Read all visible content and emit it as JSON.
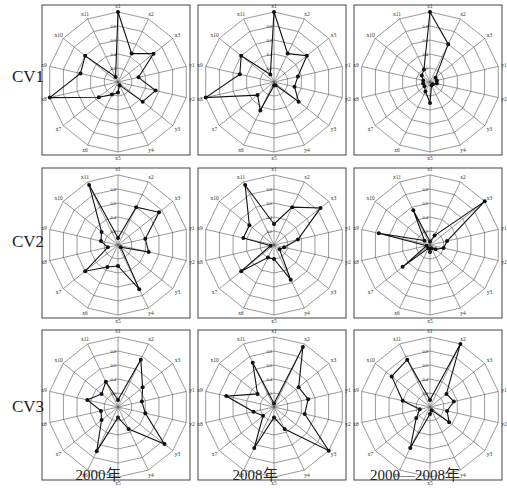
{
  "figure": {
    "row_labels": [
      "CV1",
      "CV2",
      "CV3"
    ],
    "col_labels": [
      "2000年",
      "2008年",
      "2000—2008年"
    ]
  },
  "chart_data": {
    "type": "radar",
    "axes": [
      "x1",
      "x2",
      "x3",
      "y1",
      "y2",
      "y3",
      "y4",
      "x5",
      "x6",
      "x7",
      "x8",
      "x9",
      "x10",
      "x11"
    ],
    "ring_ticks": [
      0.2,
      0.4,
      0.6,
      0.8,
      1.0
    ],
    "ring_tick_labels": [
      "0.2",
      "0.4",
      "0.6",
      "0.8"
    ],
    "rmax": 1.0,
    "grid": true,
    "colors": {
      "line": "#111111",
      "grid": "#555555",
      "frame": "#444444"
    },
    "panels": [
      {
        "row": "CV1",
        "col": "2000年",
        "values": [
          1.0,
          0.45,
          0.65,
          0.3,
          0.55,
          0.45,
          0.05,
          0.15,
          0.2,
          0.35,
          1.0,
          0.55,
          0.6,
          0.08
        ]
      },
      {
        "row": "CV1",
        "col": "2008年",
        "values": [
          1.0,
          0.45,
          0.6,
          0.35,
          0.3,
          0.45,
          0.05,
          0.05,
          0.45,
          0.3,
          1.0,
          0.5,
          0.6,
          0.12
        ]
      },
      {
        "row": "CV1",
        "col": "2000—2008年",
        "values": [
          1.0,
          0.6,
          0.1,
          0.1,
          0.1,
          0.05,
          0.05,
          0.3,
          0.15,
          0.1,
          0.1,
          0.1,
          0.15,
          0.2
        ]
      },
      {
        "row": "CV2",
        "col": "2000年",
        "values": [
          0.1,
          0.6,
          0.75,
          0.4,
          0.45,
          0.05,
          0.7,
          0.3,
          0.35,
          0.6,
          0.15,
          0.25,
          0.3,
          0.95
        ]
      },
      {
        "row": "CV2",
        "col": "2008年",
        "values": [
          0.3,
          0.6,
          0.85,
          0.35,
          0.15,
          0.1,
          0.55,
          0.2,
          0.2,
          0.6,
          0.05,
          0.45,
          0.45,
          0.95
        ]
      },
      {
        "row": "CV2",
        "col": "2000—2008年",
        "values": [
          0.05,
          0.15,
          1.0,
          0.25,
          0.2,
          0.1,
          0.05,
          0.1,
          0.05,
          0.5,
          0.05,
          0.75,
          0.1,
          0.55
        ]
      },
      {
        "row": "CV3",
        "col": "2000年",
        "values": [
          0.1,
          0.75,
          0.45,
          0.35,
          0.4,
          0.85,
          0.35,
          0.15,
          0.7,
          0.3,
          0.25,
          0.45,
          0.3,
          0.4
        ]
      },
      {
        "row": "CV3",
        "col": "2008年",
        "values": [
          0.05,
          0.95,
          0.45,
          0.5,
          0.45,
          1.0,
          0.35,
          0.15,
          0.65,
          0.2,
          0.3,
          0.7,
          0.3,
          0.7
        ]
      },
      {
        "row": "CV3",
        "col": "2000—2008年",
        "values": [
          0.1,
          1.0,
          0.3,
          0.35,
          0.25,
          0.35,
          0.05,
          0.1,
          0.65,
          0.25,
          0.15,
          0.4,
          0.7,
          0.75
        ]
      }
    ]
  }
}
